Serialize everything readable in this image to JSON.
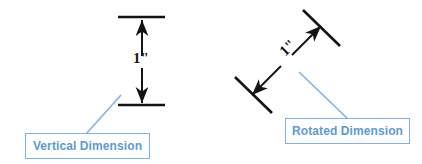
{
  "canvas": {
    "width": 422,
    "height": 164,
    "background": "#ffffff"
  },
  "colors": {
    "dimension_line": "#141414",
    "callout_border": "#7FB3E8",
    "callout_text": "#5B9BD5",
    "leader_line": "#7FB3E8",
    "callout_fill": "#ffffff"
  },
  "figures": [
    {
      "id": "vertical-dimension",
      "name": "Vertical Dimension",
      "dimension_value": "1\"",
      "orientation_degrees": 90,
      "callout": {
        "label": "Vertical Dimension",
        "x": 25,
        "y": 133,
        "width": 125,
        "height": 26
      },
      "geometry": {
        "extension_line_top": {
          "x1": 118,
          "y1": 17,
          "x2": 165,
          "y2": 17
        },
        "extension_line_bottom": {
          "x1": 118,
          "y1": 105,
          "x2": 165,
          "y2": 105
        },
        "dimension_line": {
          "x1": 142,
          "y1": 19,
          "x2": 142,
          "y2": 103
        },
        "arrow_top": "up",
        "arrow_bottom": "down",
        "leader_line": {
          "x1": 87,
          "y1": 133,
          "x2": 120,
          "y2": 96
        }
      }
    },
    {
      "id": "rotated-dimension",
      "name": "Rotated Dimension",
      "dimension_value": "1\"",
      "orientation_degrees": 45,
      "callout": {
        "label": "Rotated Dimension",
        "x": 285,
        "y": 118,
        "width": 125,
        "height": 26
      },
      "geometry": {
        "extension_line_upper": {
          "x1": 305,
          "y1": 11,
          "x2": 338,
          "y2": 44
        },
        "extension_line_lower": {
          "x1": 237,
          "y1": 78,
          "x2": 270,
          "y2": 111
        },
        "dimension_line": {
          "x1": 249,
          "y1": 90,
          "x2": 324,
          "y2": 18
        },
        "arrow_upper": "up-right",
        "arrow_lower": "down-left",
        "leader_line": {
          "x1": 347,
          "y1": 118,
          "x2": 300,
          "y2": 73
        }
      }
    }
  ],
  "labels": {
    "vertical_dimension": "Vertical Dimension",
    "rotated_dimension": "Rotated Dimension",
    "dimension_value": "1\""
  }
}
